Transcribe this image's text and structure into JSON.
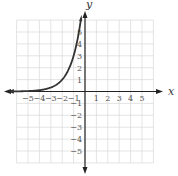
{
  "chart_data": {
    "type": "line",
    "title": "",
    "xlabel": "x",
    "ylabel": "y",
    "xlim": [
      -6,
      6
    ],
    "ylim": [
      -6,
      6
    ],
    "grid": true,
    "x_ticks": [
      "-5",
      "-4",
      "-3",
      "-2",
      "-1",
      "1",
      "2",
      "3",
      "4",
      "5"
    ],
    "y_ticks": [
      "1",
      "2",
      "3",
      "4",
      "5",
      "-1",
      "-2",
      "-3",
      "-4",
      "-5"
    ],
    "series": [
      {
        "name": "exponential curve",
        "function": "y = 3^(x+2)",
        "x": [
          -6,
          -5,
          -4,
          -3,
          -2,
          -1,
          -0.4
        ],
        "values": [
          0.01,
          0.04,
          0.11,
          0.33,
          1,
          3,
          5.8
        ],
        "arrows": "both ends"
      }
    ]
  },
  "labels": {
    "x_axis": "x",
    "y_axis": "y"
  },
  "colors": {
    "grid": "#d9d9d9",
    "axis": "#222222",
    "curve": "#333333"
  }
}
